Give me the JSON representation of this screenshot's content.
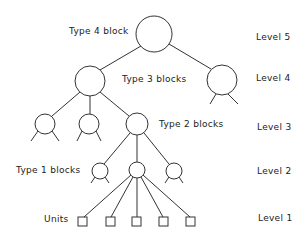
{
  "diagram": {
    "labels": {
      "type4": "Type 4 block",
      "type3": "Type 3 blocks",
      "type2": "Type 2 blocks",
      "type1": "Type 1 blocks",
      "units": "Units"
    },
    "levels": [
      "Level 5",
      "Level 4",
      "Level 3",
      "Level 2",
      "Level 1"
    ],
    "stroke_color": "#333333",
    "background": "#ffffff"
  }
}
